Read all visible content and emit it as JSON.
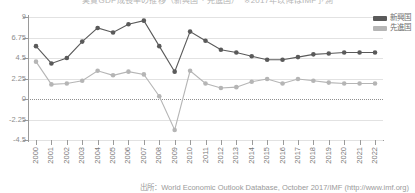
{
  "title_strip": "実質GDP成長率の推移（新興国・先進国）　※2017年以降はIMF予測",
  "legend": {
    "position": "top-right",
    "items": [
      {
        "label": "新興国",
        "color": "#5a5a5a",
        "icon": "legend-swatch"
      },
      {
        "label": "先進国",
        "color": "#b5b5b5",
        "icon": "legend-swatch"
      }
    ]
  },
  "source_note": "出所：World Economic Outlook Database, October 2017/IMF (http://www.imf.org)",
  "axis": {
    "y_ticks": [
      "9",
      "6.75",
      "4.5",
      "2.25",
      "0",
      "-2.25",
      "-4.5"
    ],
    "x_ticks": [
      "2000",
      "2001",
      "2002",
      "2003",
      "2004",
      "2005",
      "2006",
      "2007",
      "2008",
      "2009",
      "2010",
      "2011",
      "2012",
      "2013",
      "2014",
      "2015",
      "2016",
      "2017",
      "2018",
      "2019",
      "2020",
      "2021",
      "2022"
    ]
  },
  "chart_data": {
    "type": "line",
    "title": "実質GDP成長率の推移（新興国・先進国）",
    "xlabel": "",
    "ylabel": "",
    "ylim": [
      -4.5,
      9
    ],
    "yticks": [
      -4.5,
      -2.25,
      0,
      2.25,
      4.5,
      6.75,
      9
    ],
    "grid": true,
    "legend_position": "top-right",
    "categories": [
      "2000",
      "2001",
      "2002",
      "2003",
      "2004",
      "2005",
      "2006",
      "2007",
      "2008",
      "2009",
      "2010",
      "2011",
      "2012",
      "2013",
      "2014",
      "2015",
      "2016",
      "2017",
      "2018",
      "2019",
      "2020",
      "2021",
      "2022"
    ],
    "series": [
      {
        "name": "新興国",
        "color": "#5a5a5a",
        "values": [
          5.8,
          3.9,
          4.5,
          6.3,
          7.8,
          7.3,
          8.2,
          8.6,
          5.8,
          3.0,
          7.4,
          6.4,
          5.4,
          5.1,
          4.7,
          4.3,
          4.3,
          4.6,
          4.9,
          5.0,
          5.1,
          5.1,
          5.1
        ]
      },
      {
        "name": "先進国",
        "color": "#b5b5b5",
        "values": [
          4.1,
          1.6,
          1.7,
          2.0,
          3.1,
          2.6,
          3.0,
          2.7,
          0.3,
          -3.4,
          3.1,
          1.7,
          1.2,
          1.3,
          1.9,
          2.2,
          1.7,
          2.2,
          2.0,
          1.8,
          1.7,
          1.7,
          1.7
        ]
      }
    ]
  }
}
